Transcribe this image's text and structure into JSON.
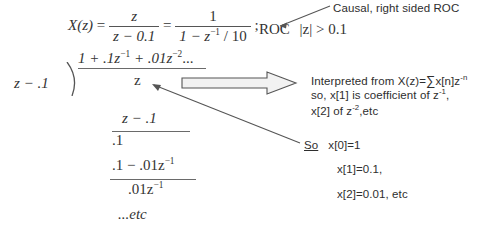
{
  "figure": {
    "title_equation": {
      "lhs": "X(z)",
      "eq1": "=",
      "frac1_num": "z",
      "frac1_den": "z − 0.1",
      "eq2": "=",
      "frac2_num": "1",
      "frac2_den": "1 − z",
      "frac2_den_exp": "−1",
      "frac2_den_tail": " / 10",
      "semicolon": ";"
    },
    "roc": {
      "label": "ROC",
      "condition": "|z| > 0.1",
      "callout": "Causal, right sided ROC"
    },
    "long_division": {
      "divisor": "z − .1",
      "quotient_terms": [
        {
          "text": "1 + .1z",
          "exp": "−1"
        },
        {
          "text": " + .01z",
          "exp": "−2"
        },
        {
          "text": "...",
          "exp": ""
        }
      ],
      "quotient_plain": "1+.1z⁻¹+.01z⁻²...",
      "dividend": "z",
      "steps": [
        {
          "expr": "z − .1",
          "exp": "",
          "ruled": true
        },
        {
          "expr": ".1",
          "exp": "",
          "ruled": false
        },
        {
          "expr": ".1 − .01z",
          "exp": "−1",
          "ruled": true
        },
        {
          "expr": ".01z",
          "exp": "−1",
          "ruled": false
        },
        {
          "expr": "...etc",
          "exp": "",
          "ruled": false
        }
      ]
    },
    "annotations": {
      "interpret_line1_a": "Interpreted from X(z)=",
      "interpret_sigma": "∑",
      "interpret_line1_b": "x[n]z",
      "interpret_line1_exp": "-n",
      "interpret_line2_a": "so, x[1] is coefficient of z",
      "interpret_line2_exp": "-1",
      "interpret_line2_b": ",",
      "interpret_line3_a": "x[2] of z",
      "interpret_line3_exp": "-2",
      "interpret_line3_b": ",etc",
      "so_label": "So",
      "result_line1": "x[0]=1",
      "result_line2": "x[1]=0.1,",
      "result_line3": "x[2]=0.01, etc"
    },
    "colors": {
      "ink": "#2e2e2e",
      "rule": "#6a6a6a",
      "arrow_outline": "#555555",
      "arrow_fill": "#f2f2f2",
      "background": "#ffffff"
    }
  }
}
